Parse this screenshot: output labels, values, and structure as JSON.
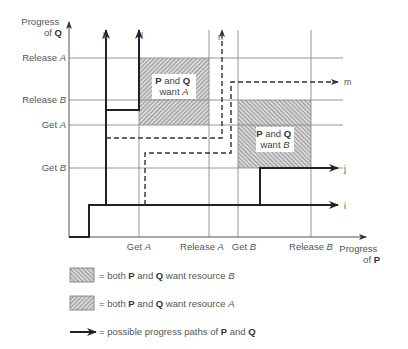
{
  "axes": {
    "y_label_line1": "Progress",
    "y_label_line2_prefix": "of ",
    "y_label_line2_bold": "Q",
    "x_label_line1": "Progress",
    "x_label_line2_prefix": "of ",
    "x_label_line2_bold": "P",
    "y_ticks": [
      {
        "text": "Release ",
        "italic": "A"
      },
      {
        "text": "Release ",
        "italic": "B"
      },
      {
        "text": "Get ",
        "italic": "A"
      },
      {
        "text": "Get ",
        "italic": "B"
      }
    ],
    "x_ticks": [
      {
        "text": "Get ",
        "italic": "A"
      },
      {
        "text": "Release ",
        "italic": "A"
      },
      {
        "text": "Get ",
        "italic": "B"
      },
      {
        "text": "Release ",
        "italic": "B"
      }
    ]
  },
  "regions": {
    "want_a": {
      "bold1": "P",
      "mid": " and ",
      "bold2": "Q",
      "line2": "want ",
      "italic": "A"
    },
    "want_b": {
      "bold1": "P",
      "mid": " and ",
      "bold2": "Q",
      "line2": "want ",
      "italic": "B"
    }
  },
  "paths": {
    "k": "k",
    "l": "l",
    "n": "n",
    "m": "m",
    "j": "j",
    "i": "i"
  },
  "legend": [
    {
      "swatch": "hatch-forward",
      "prefix": "= both ",
      "b1": "P",
      "mid": " and ",
      "b2": "Q",
      "suffix": " want resource ",
      "italic": "B"
    },
    {
      "swatch": "hatch-back",
      "prefix": "= both ",
      "b1": "P",
      "mid": " and ",
      "b2": "Q",
      "suffix": " want resource ",
      "italic": "A"
    },
    {
      "swatch": "arrow",
      "prefix": "= possible progress paths of ",
      "b1": "P",
      "mid": " and ",
      "b2": "Q",
      "suffix": "",
      "italic": ""
    }
  ],
  "colors": {
    "grid": "#8a8a8a",
    "path": "#222222",
    "hatch": "#777777",
    "text": "#555555"
  }
}
